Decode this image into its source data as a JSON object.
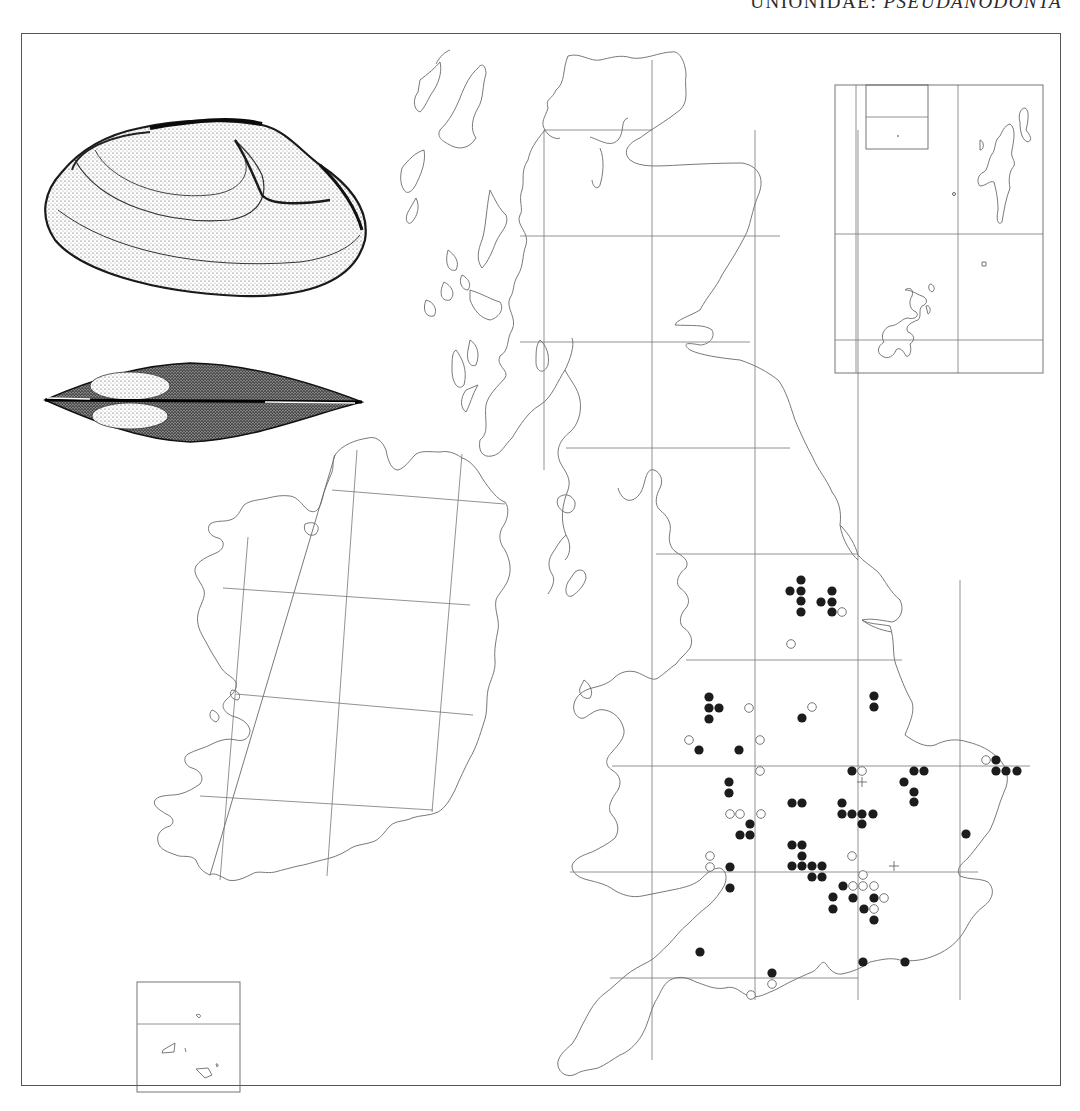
{
  "header": {
    "family": "UNIONIDAE:",
    "genus": "PSEUDANODONTA"
  },
  "illustrations": [
    {
      "name": "shell-lateral-view",
      "x": 40,
      "y": 120,
      "w": 325,
      "h": 178
    },
    {
      "name": "shell-dorsal-view",
      "x": 45,
      "y": 360,
      "w": 318,
      "h": 82
    }
  ],
  "grid": {
    "gb_verticals": [
      {
        "x": 544,
        "y1": 130,
        "y2": 470
      },
      {
        "x": 652,
        "y1": 60,
        "y2": 1060
      },
      {
        "x": 755,
        "y1": 130,
        "y2": 1000
      },
      {
        "x": 858,
        "y1": 130,
        "y2": 1000
      },
      {
        "x": 960,
        "y1": 580,
        "y2": 1000
      }
    ],
    "gb_horizontals": [
      {
        "y": 130,
        "x1": 544,
        "x2": 652
      },
      {
        "y": 236,
        "x1": 520,
        "x2": 780
      },
      {
        "y": 342,
        "x1": 520,
        "x2": 750
      },
      {
        "y": 448,
        "x1": 566,
        "x2": 790
      },
      {
        "y": 554,
        "x1": 656,
        "x2": 858
      },
      {
        "y": 660,
        "x1": 686,
        "x2": 902
      },
      {
        "y": 766,
        "x1": 612,
        "x2": 1030
      },
      {
        "y": 872,
        "x1": 570,
        "x2": 978
      },
      {
        "y": 978,
        "x1": 610,
        "x2": 858
      }
    ]
  },
  "legend_symbols": {
    "filled": "post-1965 record",
    "open": "pre-1965 record",
    "cross": "unlocalised record"
  },
  "records": {
    "filled": [
      [
        801,
        580
      ],
      [
        790,
        591
      ],
      [
        801,
        591
      ],
      [
        801,
        601
      ],
      [
        801,
        612
      ],
      [
        832,
        591
      ],
      [
        821,
        602
      ],
      [
        832,
        602
      ],
      [
        832,
        612
      ],
      [
        709,
        697
      ],
      [
        709,
        708
      ],
      [
        719,
        708
      ],
      [
        709,
        719
      ],
      [
        699,
        750
      ],
      [
        739,
        750
      ],
      [
        802,
        718
      ],
      [
        874,
        696
      ],
      [
        874,
        707
      ],
      [
        852,
        771
      ],
      [
        729,
        782
      ],
      [
        729,
        793
      ],
      [
        792,
        803
      ],
      [
        802,
        803
      ],
      [
        842,
        803
      ],
      [
        842,
        814
      ],
      [
        852,
        814
      ],
      [
        862,
        814
      ],
      [
        873,
        814
      ],
      [
        862,
        824
      ],
      [
        750,
        824
      ],
      [
        740,
        835
      ],
      [
        750,
        835
      ],
      [
        792,
        845
      ],
      [
        802,
        845
      ],
      [
        802,
        856
      ],
      [
        730,
        867
      ],
      [
        730,
        888
      ],
      [
        792,
        866
      ],
      [
        802,
        866
      ],
      [
        812,
        866
      ],
      [
        822,
        866
      ],
      [
        812,
        877
      ],
      [
        822,
        877
      ],
      [
        843,
        886
      ],
      [
        833,
        897
      ],
      [
        853,
        898
      ],
      [
        874,
        898
      ],
      [
        833,
        909
      ],
      [
        864,
        909
      ],
      [
        874,
        920
      ],
      [
        914,
        771
      ],
      [
        924,
        771
      ],
      [
        904,
        782
      ],
      [
        914,
        792
      ],
      [
        914,
        802
      ],
      [
        996,
        760
      ],
      [
        996,
        771
      ],
      [
        1006,
        771
      ],
      [
        1017,
        771
      ],
      [
        966,
        834
      ],
      [
        700,
        952
      ],
      [
        772,
        973
      ],
      [
        863,
        962
      ],
      [
        905,
        962
      ]
    ],
    "open": [
      [
        842,
        612
      ],
      [
        791,
        644
      ],
      [
        749,
        708
      ],
      [
        812,
        707
      ],
      [
        689,
        740
      ],
      [
        760,
        740
      ],
      [
        760,
        771
      ],
      [
        862,
        771
      ],
      [
        730,
        814
      ],
      [
        740,
        814
      ],
      [
        761,
        814
      ],
      [
        852,
        856
      ],
      [
        710,
        856
      ],
      [
        710,
        867
      ],
      [
        863,
        875
      ],
      [
        853,
        886
      ],
      [
        863,
        886
      ],
      [
        874,
        886
      ],
      [
        884,
        898
      ],
      [
        874,
        909
      ],
      [
        986,
        760
      ],
      [
        772,
        984
      ],
      [
        751,
        995
      ]
    ],
    "cross": [
      [
        862,
        782
      ],
      [
        894,
        866
      ]
    ]
  }
}
